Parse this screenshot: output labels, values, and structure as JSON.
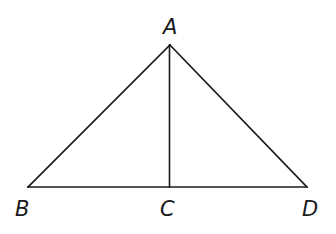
{
  "diagram": {
    "type": "geometry-triangle",
    "points": {
      "A": {
        "label": "A",
        "x": 170,
        "y": 45
      },
      "B": {
        "label": "B",
        "x": 28,
        "y": 187
      },
      "C": {
        "label": "C",
        "x": 169,
        "y": 187
      },
      "D": {
        "label": "D",
        "x": 307,
        "y": 187
      }
    },
    "segments": [
      {
        "name": "AB",
        "from": "A",
        "to": "B"
      },
      {
        "name": "AD",
        "from": "A",
        "to": "D"
      },
      {
        "name": "BD",
        "from": "B",
        "to": "D"
      },
      {
        "name": "AC",
        "from": "A",
        "to": "C"
      }
    ],
    "labels": {
      "A": "A",
      "B": "B",
      "C": "C",
      "D": "D"
    }
  }
}
